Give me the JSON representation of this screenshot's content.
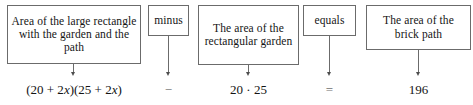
{
  "diagram": {
    "type": "word-equation-flow",
    "columns": [
      {
        "box_label": "Area of the large rectangle with the garden and the path",
        "formula_plain": "(20 + 2x)(25 + 2x)",
        "formula_parts": [
          {
            "text": "(20 + 2",
            "italic": false
          },
          {
            "text": "x",
            "italic": true
          },
          {
            "text": ")(25 + 2",
            "italic": false
          },
          {
            "text": "x",
            "italic": true
          },
          {
            "text": ")",
            "italic": false
          }
        ]
      },
      {
        "box_label": "minus",
        "formula_plain": "−",
        "formula_parts": [
          {
            "text": "−",
            "italic": false
          }
        ]
      },
      {
        "box_label": "The area of the rectangular garden",
        "formula_plain": "20 · 25",
        "formula_parts": [
          {
            "text": "20 · 25",
            "italic": false
          }
        ]
      },
      {
        "box_label": "equals",
        "formula_plain": "=",
        "formula_parts": [
          {
            "text": "=",
            "italic": false
          }
        ]
      },
      {
        "box_label": "The area of the brick path",
        "formula_plain": "196",
        "formula_parts": [
          {
            "text": "196",
            "italic": false
          }
        ]
      }
    ],
    "colors": {
      "background": "#ffffff",
      "box_border": "#6b6b6b",
      "text": "#151515",
      "arrow": "#4d4d4d"
    }
  }
}
